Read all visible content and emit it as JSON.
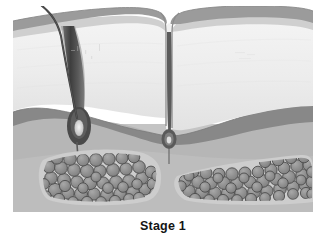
{
  "figure": {
    "caption": "Stage 1",
    "alt_description": "Grayscale cross-sectional illustration of skin showing hair follicle, dermis layers and subcutaneous fat lobules"
  },
  "palette": {
    "background": "#ffffff",
    "stratum_corneum": "#9d9d9d",
    "epidermis_light": "#c6c6c6",
    "dermis_upper": "#f0f0f0",
    "dermis_mid": "#e6e6e6",
    "reticular_band": "#8f8f8f",
    "deep_dermis": "#b4b4b4",
    "hypodermis_septa": "#c2c2c2",
    "fat_cell_fill": "#8c8c8c",
    "fat_cell_stroke": "#4a4a4a",
    "follicle_dark": "#4f4f4f",
    "follicle_sheath": "#747474",
    "hair_shaft": "#3a3a3a",
    "papilla_light": "#e2e2e2",
    "caption_text": "#141414"
  },
  "layers": [
    {
      "id": "hair-shaft",
      "label": "Hair shaft",
      "visible": true
    },
    {
      "id": "stratum-corneum",
      "label": "Stratum corneum",
      "visible": true
    },
    {
      "id": "epidermis",
      "label": "Epidermis",
      "visible": true
    },
    {
      "id": "dermis",
      "label": "Dermis",
      "visible": true
    },
    {
      "id": "reticular-dermis-band",
      "label": "Reticular dermis band",
      "visible": true
    },
    {
      "id": "hypodermis",
      "label": "Hypodermis",
      "visible": true
    },
    {
      "id": "fat-lobule-left",
      "label": "Left fat lobule",
      "visible": true
    },
    {
      "id": "fat-lobule-right",
      "label": "Right fat lobule",
      "visible": true
    },
    {
      "id": "terminal-follicle",
      "label": "Terminal hair follicle",
      "visible": true
    },
    {
      "id": "vellus-follicle",
      "label": "Vellus hair follicle in furrow",
      "visible": true
    }
  ],
  "structures": {
    "terminal_follicle": {
      "name": "terminal-hair-follicle",
      "bulb_x": 66,
      "bulb_y": 132
    },
    "vellus_follicle": {
      "name": "vellus-hair-follicle",
      "bulb_x": 155,
      "bulb_y": 140
    },
    "furrow": {
      "name": "skin-furrow",
      "x": 155
    },
    "fat_lobule_left": {
      "name": "fat-lobule-left",
      "cell_count": 52
    },
    "fat_lobule_right": {
      "name": "fat-lobule-right",
      "cell_count": 58
    }
  }
}
